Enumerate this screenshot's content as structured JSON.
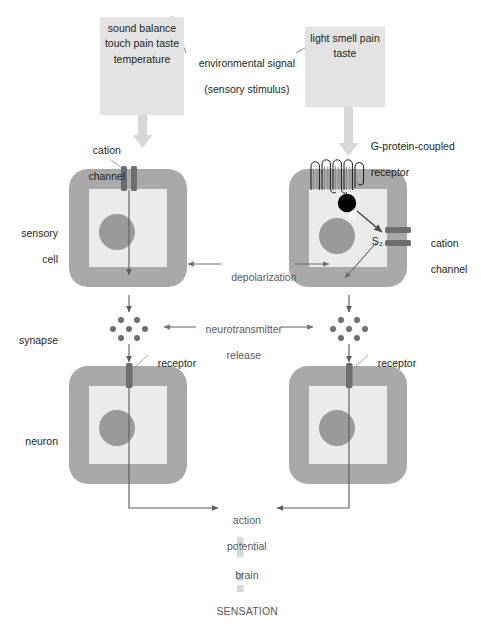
{
  "diagram": {
    "title_hidden": "Sensory signal transduction pathway",
    "stimulus_left": {
      "name": "mechanical-and-chemical-stimuli-box",
      "items": [
        "sound",
        "balance",
        "touch",
        "pain",
        "taste",
        "temperature"
      ],
      "text": "sound\nbalance\ntouch\npain\ntaste\ntemperature"
    },
    "stimulus_right": {
      "name": "light-and-chemical-stimuli-box",
      "items": [
        "light",
        "smell",
        "pain",
        "taste"
      ],
      "text": "light\nsmell\npain\ntaste"
    },
    "center_top_label": {
      "line1": "environmental signal",
      "line2": "(sensory stimulus)",
      "text": "environmental signal\n(sensory stimulus)"
    },
    "left_column": {
      "cation_channel": "cation\nchannel",
      "cation_channel_line1": "cation",
      "cation_channel_line2": "channel"
    },
    "right_column": {
      "gpcr_label": "G-protein-coupled\nreceptor",
      "gpcr_line1": "G-protein-coupled",
      "gpcr_line2": "receptor",
      "g_protein_letter": "G",
      "second_messenger": "S₂",
      "cation_channel": "cation\nchannel",
      "cation_channel_line1": "cation",
      "cation_channel_line2": "channel"
    },
    "row_labels": {
      "sensory_cell": "sensory\ncell",
      "sensory_cell_line1": "sensory",
      "sensory_cell_line2": "cell",
      "synapse": "synapse",
      "neuron": "neuron"
    },
    "middle_labels": {
      "depolarization": "depolarization",
      "neurotransmitter_release": "neurotransmitter\nrelease",
      "neurotransmitter_release_line1": "neurotransmitter",
      "neurotransmitter_release_line2": "release",
      "receptor_left": "receptor",
      "receptor_right": "receptor"
    },
    "outcome": {
      "action_potential_line1": "action",
      "action_potential_line2": "potential",
      "action_potential": "action\npotential",
      "brain": "brain",
      "sensation": "SENSATION"
    },
    "colors": {
      "membrane": "#a9a9a9",
      "cytoplasm": "#ebebeb",
      "nucleus": "#9a9a9a",
      "channel": "#6d6e70",
      "stimulus_box": "#e3e3e3",
      "arrow_pale": "#d8d8d8",
      "arrow_dark": "#5a5a5a",
      "g_protein": "#000000",
      "text": "#231f20",
      "text_gray": "#58595b",
      "background": "#ffffff"
    },
    "counts": {
      "gpcr_helices": 7,
      "neurotransmitter_dots_left": 7,
      "neurotransmitter_dots_right": 7
    }
  }
}
